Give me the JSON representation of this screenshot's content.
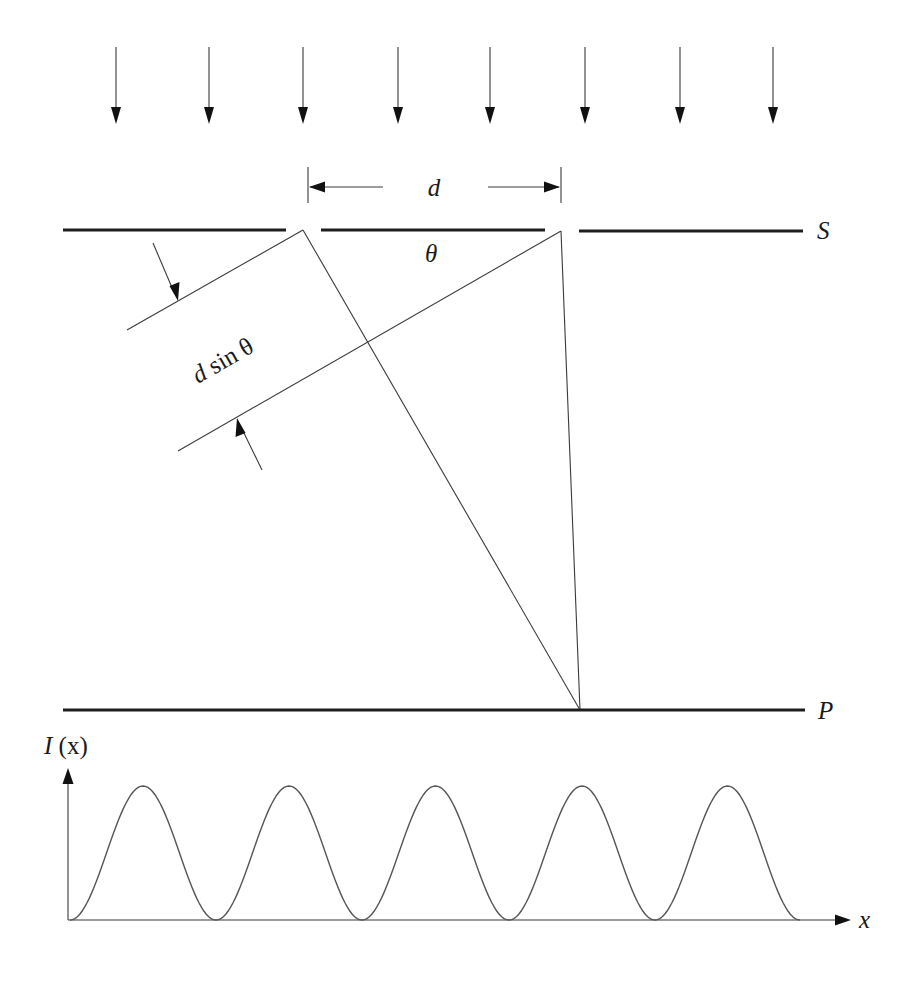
{
  "figure": {
    "labels": {
      "slit_separation": "d",
      "angle": "θ",
      "path_difference_d": "d",
      "path_difference_rest": " sin θ",
      "screen_s": "S",
      "screen_p": "P",
      "intensity_axis_I": "I",
      "intensity_axis_x": " (x)",
      "x_axis": "x"
    },
    "incident_arrows": {
      "count": 8,
      "x_positions": [
        116,
        209,
        303,
        398,
        490,
        585,
        680,
        773
      ],
      "y_start": 47,
      "y_tip": 124
    },
    "barrier_S": {
      "y": 230,
      "segments": [
        [
          63,
          286
        ],
        [
          321,
          545
        ],
        [
          579,
          803
        ]
      ],
      "slit_left_x": 303,
      "slit_right_x": 561
    },
    "screen_P": {
      "y": 710,
      "x_start": 63,
      "x_end": 805
    },
    "convergence_point": {
      "x": 580,
      "y": 710
    },
    "colors": {
      "ink": "#1e1e1e",
      "thin_line": "#3a3a3a",
      "wave": "#555555",
      "background": "#ffffff"
    }
  },
  "chart_data": {
    "type": "line",
    "title": "",
    "xlabel": "x",
    "ylabel": "I (x)",
    "peak_x_pixels": [
      144,
      289,
      436,
      581,
      727
    ],
    "minimum_x_pixels": [
      70,
      216,
      362,
      509,
      655,
      800
    ],
    "baseline_y_pixel": 920,
    "peak_y_pixel": 786,
    "num_peaks": 5,
    "relative_peak_heights": [
      1,
      1,
      1,
      1,
      1
    ],
    "grid": false
  }
}
